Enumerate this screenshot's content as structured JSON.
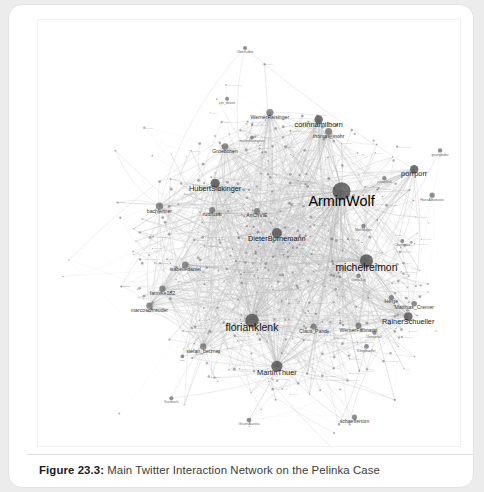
{
  "page": {
    "background_color": "#ececed",
    "card_color": "#ffffff"
  },
  "caption": {
    "figure_number": "Figure 23.3:",
    "text": "Main Twitter Interaction Network on the Pelinka Case"
  },
  "figure": {
    "title": "Main Twitter Interaction Network on the Pelinka Case",
    "kind": "network-graph"
  },
  "chart_data": {
    "type": "scatter",
    "title": "Main Twitter Interaction Network on the Pelinka Case",
    "xlabel": "",
    "ylabel": "",
    "grid": false,
    "legend": null,
    "layout": "force-directed",
    "node_color": "#6f6f71",
    "edge_color": "#b9b9ba",
    "xlim": [
      0,
      424
    ],
    "ylim": [
      0,
      428
    ],
    "nodes": [
      {
        "id": "ArminWolf",
        "label": "ArminWolf",
        "x": 305,
        "y": 172,
        "size": 9.0,
        "tier": "xxl"
      },
      {
        "id": "michelreimon",
        "label": "michelreimon",
        "x": 330,
        "y": 242,
        "size": 6.6,
        "tier": "xl"
      },
      {
        "id": "florianklenk",
        "label": "florianklenk",
        "x": 215,
        "y": 302,
        "size": 6.8,
        "tier": "xl"
      },
      {
        "id": "MartinThuer",
        "label": "MartinThuer",
        "x": 240,
        "y": 348,
        "size": 5.6,
        "tier": "l"
      },
      {
        "id": "DieterBornemann",
        "label": "DieterBornemann",
        "x": 240,
        "y": 214,
        "size": 5.0,
        "tier": "l"
      },
      {
        "id": "HubertSickinger",
        "label": "HubertSickinger",
        "x": 178,
        "y": 164,
        "size": 4.6,
        "tier": "l"
      },
      {
        "id": "RainerSchueller",
        "label": "RainerSchueller",
        "x": 372,
        "y": 298,
        "size": 4.4,
        "tier": "l"
      },
      {
        "id": "corinnamilborn",
        "label": "corinnamilborn",
        "x": 282,
        "y": 100,
        "size": 4.2,
        "tier": "l"
      },
      {
        "id": "porrporr",
        "label": "porrporr",
        "x": 378,
        "y": 150,
        "size": 4.2,
        "tier": "l"
      },
      {
        "id": "thomas_mohr",
        "label": "thomas_mohr",
        "x": 292,
        "y": 112,
        "size": 3.6,
        "tier": "m"
      },
      {
        "id": "WernerReisinger",
        "label": "WernerReisinger",
        "x": 233,
        "y": 93,
        "size": 3.6,
        "tier": "m"
      },
      {
        "id": "bachleitner",
        "label": "bachleitner",
        "x": 122,
        "y": 187,
        "size": 3.6,
        "tier": "m"
      },
      {
        "id": "isabelledaniel",
        "label": "isabelledaniel",
        "x": 148,
        "y": 246,
        "size": 3.4,
        "tier": "m"
      },
      {
        "id": "fatmike182",
        "label": "fatmike182",
        "x": 125,
        "y": 270,
        "size": 3.2,
        "tier": "m"
      },
      {
        "id": "marcoschreuder",
        "label": "marcoschreuder",
        "x": 112,
        "y": 287,
        "size": 3.2,
        "tier": "m"
      },
      {
        "id": "stefan_betzner",
        "label": "stefan_betzner",
        "x": 166,
        "y": 328,
        "size": 3.2,
        "tier": "m"
      },
      {
        "id": "Groebchen",
        "label": "Groebchen",
        "x": 188,
        "y": 127,
        "size": 3.2,
        "tier": "m"
      },
      {
        "id": "rudifussi",
        "label": "rudifussi",
        "x": 175,
        "y": 191,
        "size": 3.0,
        "tier": "m"
      },
      {
        "id": "AnChVIE",
        "label": "AnChVIE",
        "x": 220,
        "y": 192,
        "size": 3.0,
        "tier": "m"
      },
      {
        "id": "Claus_Pandi",
        "label": "Claus_Pandi",
        "x": 277,
        "y": 308,
        "size": 3.0,
        "tier": "m"
      },
      {
        "id": "WernerFallmann",
        "label": "WernerFallmann",
        "x": 322,
        "y": 307,
        "size": 3.0,
        "tier": "m"
      },
      {
        "id": "Matthias_Cremer",
        "label": "Matthias_Cremer",
        "x": 378,
        "y": 285,
        "size": 2.8,
        "tier": "m"
      },
      {
        "id": "Hedwig",
        "label": "Helge",
        "x": 355,
        "y": 279,
        "size": 2.6,
        "tier": "m"
      },
      {
        "id": "HansAlbanovic",
        "label": "HansAlbanovic",
        "x": 396,
        "y": 176,
        "size": 2.6,
        "tier": "s"
      },
      {
        "id": "schaeffertom",
        "label": "schaeffertom",
        "x": 318,
        "y": 399,
        "size": 2.6,
        "tier": "m"
      },
      {
        "id": "GruenAustria",
        "label": "GruenAustria",
        "x": 212,
        "y": 402,
        "size": 2.4,
        "tier": "s"
      },
      {
        "id": "Klingbaeller",
        "label": "Klingbaeller",
        "x": 330,
        "y": 328,
        "size": 2.4,
        "tier": "s"
      },
      {
        "id": "Jonasnoll",
        "label": "Jonasnoll",
        "x": 338,
        "y": 314,
        "size": 2.2,
        "tier": "s"
      },
      {
        "id": "GretaTag",
        "label": "GretaTag",
        "x": 322,
        "y": 257,
        "size": 2.2,
        "tier": "s"
      },
      {
        "id": "MoriMayer",
        "label": "MoriMayer",
        "x": 327,
        "y": 207,
        "size": 2.2,
        "tier": "s"
      },
      {
        "id": "jannelljuli",
        "label": "jannelljuli",
        "x": 348,
        "y": 159,
        "size": 2.2,
        "tier": "s"
      },
      {
        "id": "georgbider",
        "label": "georgbider",
        "x": 404,
        "y": 131,
        "size": 2.2,
        "tier": "s"
      },
      {
        "id": "Chutjenko",
        "label": "Chutjenko",
        "x": 366,
        "y": 222,
        "size": 2.0,
        "tier": "s"
      },
      {
        "id": "kurtbach",
        "label": "Kurtbach",
        "x": 134,
        "y": 380,
        "size": 2.0,
        "tier": "s"
      },
      {
        "id": "olabo",
        "label": "olabo",
        "x": 300,
        "y": 435,
        "size": 2.0,
        "tier": "s"
      },
      {
        "id": "oberhuber",
        "label": "Oberhuber",
        "x": 208,
        "y": 28,
        "size": 2.0,
        "tier": "s"
      },
      {
        "id": "capt_dezeit",
        "label": "cpt_dezeit",
        "x": 190,
        "y": 79,
        "size": 2.0,
        "tier": "s"
      },
      {
        "id": "martinblumenau",
        "label": "martinblumenau",
        "x": 215,
        "y": 118,
        "size": 2.0,
        "tier": "s"
      },
      {
        "id": "Natl",
        "label": "Natl",
        "x": 145,
        "y": 338,
        "size": 1.8,
        "tier": "xs"
      }
    ],
    "node_count": 39,
    "edge_count": 240
  }
}
